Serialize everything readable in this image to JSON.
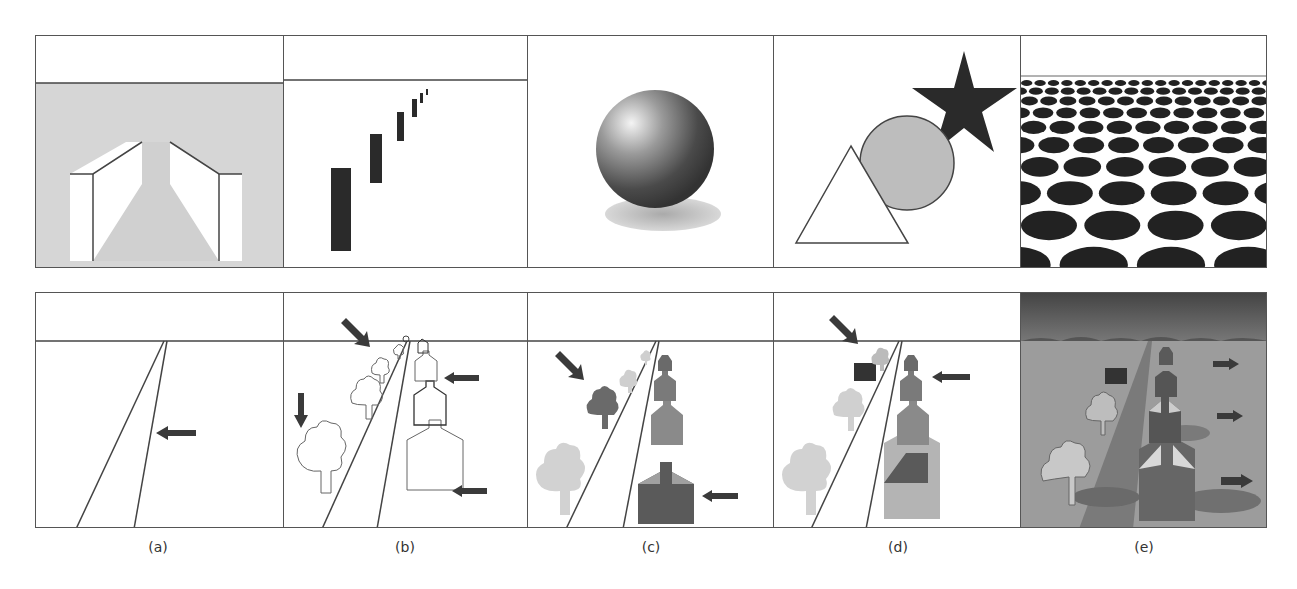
{
  "figure": {
    "labels": [
      "(a)",
      "(b)",
      "(c)",
      "(d)",
      "(e)"
    ],
    "top_row": [
      {
        "id": "a",
        "cue": "linear perspective walls",
        "background": "#d8d8d8"
      },
      {
        "id": "b",
        "cue": "relative size and height bars"
      },
      {
        "id": "c",
        "cue": "shading and cast shadow sphere"
      },
      {
        "id": "d",
        "cue": "occlusion shapes: triangle, circle, star"
      },
      {
        "id": "e",
        "cue": "texture gradient ellipses"
      }
    ],
    "bottom_row": [
      {
        "id": "a",
        "cue": "road converging to horizon",
        "arrows": 1
      },
      {
        "id": "b",
        "cue": "outlined trees and houses",
        "arrows": 4
      },
      {
        "id": "c",
        "cue": "shaded trees and houses",
        "arrows": 2
      },
      {
        "id": "d",
        "cue": "shaded scene with occluding box",
        "arrows": 2
      },
      {
        "id": "e",
        "cue": "full textured scene with shadows",
        "arrows": 3
      }
    ],
    "colors": {
      "line": "#444444",
      "dark": "#2a2a2a",
      "gray": "#bdbdbd",
      "ground": "#9a9a9a",
      "sky": "#5a5a5a"
    }
  }
}
